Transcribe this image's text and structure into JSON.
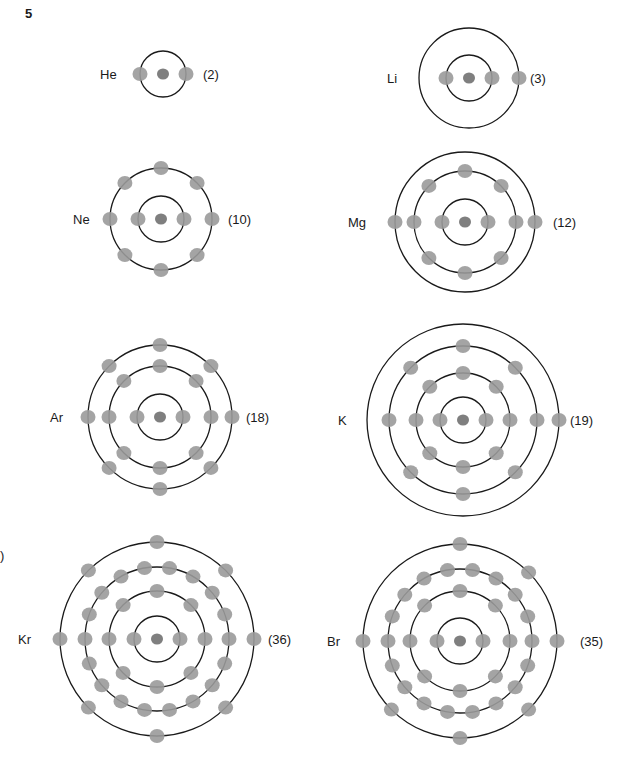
{
  "figure": {
    "number": "5",
    "side_mark": ")"
  },
  "colors": {
    "shell": "#1a1a1a",
    "electron": "#9a9a9a",
    "nucleus": "#7f7f7f",
    "text": "#1a1a1a"
  },
  "atoms": [
    {
      "symbol": "He",
      "count": "(2)",
      "cx": 163,
      "cy": 74,
      "shells": [
        23
      ],
      "electrons": [
        2
      ],
      "label_x": 100,
      "count_x": 203
    },
    {
      "symbol": "Li",
      "count": "(3)",
      "cx": 469,
      "cy": 78,
      "shells": [
        23,
        50
      ],
      "electrons": [
        2,
        1
      ],
      "label_x": 387,
      "count_x": 530
    },
    {
      "symbol": "Ne",
      "count": "(10)",
      "cx": 161,
      "cy": 219,
      "shells": [
        23,
        51
      ],
      "electrons": [
        2,
        8
      ],
      "label_x": 73,
      "count_x": 228
    },
    {
      "symbol": "Mg",
      "count": "(12)",
      "cx": 465,
      "cy": 222,
      "shells": [
        23,
        51,
        70
      ],
      "electrons": [
        2,
        8,
        2
      ],
      "label_x": 348,
      "count_x": 553
    },
    {
      "symbol": "Ar",
      "count": "(18)",
      "cx": 160,
      "cy": 417,
      "shells": [
        23,
        51,
        72
      ],
      "electrons": [
        2,
        8,
        8
      ],
      "label_x": 50,
      "count_x": 246
    },
    {
      "symbol": "K",
      "count": "(19)",
      "cx": 463,
      "cy": 420,
      "shells": [
        23,
        47,
        74,
        96
      ],
      "electrons": [
        2,
        8,
        8,
        1
      ],
      "label_x": 338,
      "count_x": 570
    },
    {
      "symbol": "Kr",
      "count": "(36)",
      "cx": 157,
      "cy": 639,
      "shells": [
        23,
        48,
        72,
        97
      ],
      "electrons": [
        2,
        8,
        18,
        8
      ],
      "label_x": 18,
      "count_x": 268
    },
    {
      "symbol": "Br",
      "count": "(35)",
      "cx": 460,
      "cy": 641,
      "shells": [
        23,
        50,
        72,
        97
      ],
      "electrons": [
        2,
        8,
        18,
        7
      ],
      "label_x": 327,
      "count_x": 580
    }
  ]
}
